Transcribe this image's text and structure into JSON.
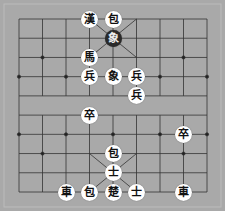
{
  "game": "xiangqi",
  "board": {
    "cols": 9,
    "rows": 10,
    "background": "#a9a9a9",
    "line_color": "#333333"
  },
  "pieces": [
    {
      "char": "漢",
      "col": 3,
      "row": 0,
      "style": "light"
    },
    {
      "char": "包",
      "col": 4,
      "row": 0,
      "style": "light"
    },
    {
      "char": "象",
      "col": 4,
      "row": 1,
      "style": "dark"
    },
    {
      "char": "馬",
      "col": 3,
      "row": 2,
      "style": "light"
    },
    {
      "char": "兵",
      "col": 3,
      "row": 3,
      "style": "light"
    },
    {
      "char": "象",
      "col": 4,
      "row": 3,
      "style": "light"
    },
    {
      "char": "兵",
      "col": 5,
      "row": 3,
      "style": "light"
    },
    {
      "char": "兵",
      "col": 5,
      "row": 4,
      "style": "light"
    },
    {
      "char": "卒",
      "col": 3,
      "row": 5,
      "style": "light"
    },
    {
      "char": "卒",
      "col": 7,
      "row": 6,
      "style": "light"
    },
    {
      "char": "包",
      "col": 4,
      "row": 7,
      "style": "light"
    },
    {
      "char": "士",
      "col": 4,
      "row": 8,
      "style": "light"
    },
    {
      "char": "車",
      "col": 2,
      "row": 9,
      "style": "light"
    },
    {
      "char": "包",
      "col": 3,
      "row": 9,
      "style": "light"
    },
    {
      "char": "楚",
      "col": 4,
      "row": 9,
      "style": "light"
    },
    {
      "char": "士",
      "col": 5,
      "row": 9,
      "style": "light"
    },
    {
      "char": "車",
      "col": 7,
      "row": 9,
      "style": "light"
    }
  ]
}
